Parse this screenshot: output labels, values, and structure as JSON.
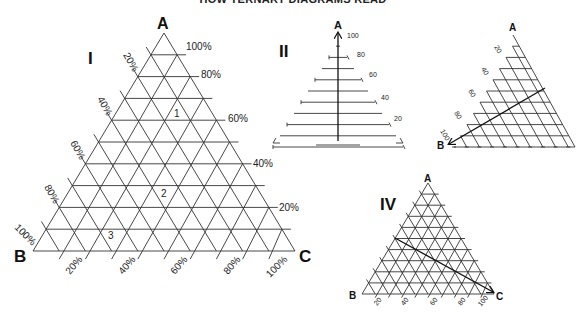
{
  "title": "HOW TERNARY DIAGRAMS READ",
  "panels": {
    "I": {
      "label": "I",
      "vertices": {
        "a": "A",
        "b": "B",
        "c": "C"
      },
      "a_ticks": [
        "100%",
        "80%",
        "60%",
        "40%",
        "20%"
      ],
      "b_ticks": [
        "20%",
        "40%",
        "60%",
        "80%",
        "100%"
      ],
      "c_ticks": [
        "20%",
        "40%",
        "60%",
        "80%",
        "100%"
      ],
      "points": [
        "1",
        "2",
        "3"
      ]
    },
    "II": {
      "label": "II",
      "vertex": "A",
      "ticks": [
        "100",
        "80",
        "60",
        "40",
        "20"
      ]
    },
    "III": {
      "vertices": {
        "a": "A",
        "b": "B"
      },
      "ticks": [
        "20",
        "40",
        "60",
        "80",
        "100"
      ]
    },
    "IV": {
      "label": "IV",
      "vertices": {
        "a": "A",
        "b": "B",
        "c": "C"
      },
      "ticks": [
        "20",
        "40",
        "60",
        "80",
        "100"
      ]
    }
  },
  "chart_data": {
    "type": "ternary",
    "title": "HOW TERNARY DIAGRAMS READ",
    "components": [
      "A",
      "B",
      "C"
    ],
    "grid_divisions": 10,
    "panels": [
      {
        "id": "I",
        "description": "Full ternary grid with percentage labels on all three axes",
        "plotted_points": [
          "1",
          "2",
          "3"
        ],
        "axis_ticks_percent": [
          20,
          40,
          60,
          80,
          100
        ]
      },
      {
        "id": "II",
        "description": "Reading component A: horizontal lines parallel to base BC",
        "ticks": [
          100,
          80,
          60,
          40,
          20
        ]
      },
      {
        "id": "III",
        "description": "Reading component B: lines parallel to side AC, arrow toward B",
        "ticks": [
          20,
          40,
          60,
          80,
          100
        ]
      },
      {
        "id": "IV",
        "description": "Reading component C: lines parallel to side AB, arrow toward C",
        "ticks": [
          20,
          40,
          60,
          80,
          100
        ]
      }
    ]
  }
}
